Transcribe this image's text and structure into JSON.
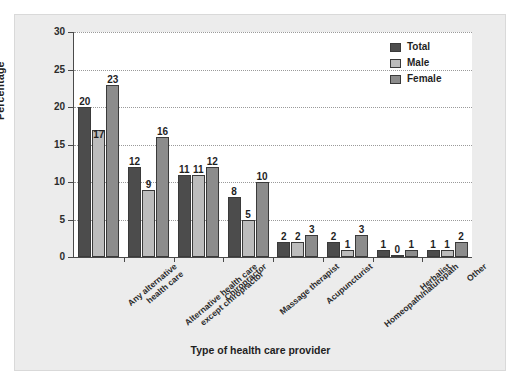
{
  "chart_data": {
    "type": "bar",
    "title": "",
    "xlabel": "Type of health care provider",
    "ylabel": "Percentage",
    "ylim": [
      0,
      30
    ],
    "yticks": [
      0,
      5,
      10,
      15,
      20,
      25,
      30
    ],
    "grid": true,
    "legend_position": "top-right",
    "categories": [
      "Any alternative\nhealth care",
      "Alternative health care\nexcept chiropractor",
      "Chiropractor",
      "Massage therapist",
      "Acupuncturist",
      "Homeopath/naturopath",
      "Herbalist",
      "Other"
    ],
    "series": [
      {
        "name": "Total",
        "color": "#4c4c4c",
        "values": [
          20,
          12,
          11,
          8,
          2,
          2,
          1,
          1
        ]
      },
      {
        "name": "Male",
        "color": "#bcbcbc",
        "values": [
          17,
          9,
          11,
          5,
          2,
          1,
          0,
          1
        ]
      },
      {
        "name": "Female",
        "color": "#8c8c8c",
        "values": [
          23,
          16,
          12,
          10,
          3,
          3,
          1,
          2
        ]
      }
    ]
  },
  "legend": {
    "items": [
      {
        "label": "Total"
      },
      {
        "label": "Male"
      },
      {
        "label": "Female"
      }
    ]
  }
}
